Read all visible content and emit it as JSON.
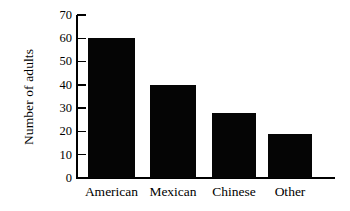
{
  "chart_data": {
    "type": "bar",
    "title": "",
    "xlabel": "",
    "ylabel": "Number of adults",
    "categories": [
      "American",
      "Mexican",
      "Chinese",
      "Other"
    ],
    "values": [
      60,
      40,
      28,
      19
    ],
    "ylim": [
      0,
      70
    ],
    "yticks": [
      0,
      10,
      20,
      30,
      40,
      50,
      60,
      70
    ],
    "ytick_labels": [
      "0",
      "10",
      "20",
      "30",
      "40",
      "50",
      "60",
      "70"
    ],
    "grid": false,
    "legend": null,
    "bar_color": "#050505",
    "axis_color": "#000000",
    "background_color": "#ffffff"
  }
}
